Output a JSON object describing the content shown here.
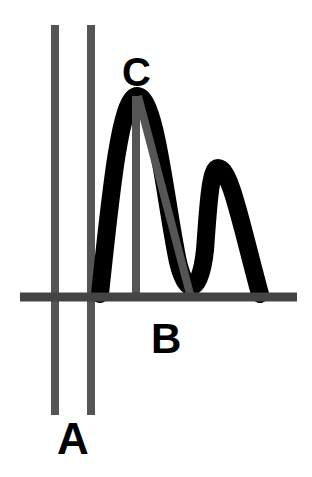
{
  "diagram": {
    "background": "#ffffff",
    "colors": {
      "curve": "#000000",
      "lines": "#555555",
      "text": "#000000"
    },
    "labels": {
      "peak": "C",
      "baseline_point": "B",
      "parallel_lines": "A"
    },
    "elements": {
      "baseline": {
        "x1": 20,
        "y1": 297,
        "x2": 297,
        "y2": 297,
        "width": 9
      },
      "line_a_left": {
        "x1": 55,
        "y1": 25,
        "x2": 55,
        "y2": 415,
        "width": 8
      },
      "line_a_right": {
        "x1": 91,
        "y1": 25,
        "x2": 91,
        "y2": 415,
        "width": 8
      },
      "peak_vertical": {
        "x1": 136,
        "y1": 96,
        "x2": 136,
        "y2": 296,
        "width": 8
      },
      "peak_diagonal": {
        "x1": 138,
        "y1": 96,
        "x2": 190,
        "y2": 294,
        "width": 8
      },
      "curve_path": "M 100 294 C 110 200, 120 96, 137 96 C 156 96, 165 200, 178 262 C 186 296, 200 296, 205 250 C 208 210, 210 168, 218 168 C 230 168, 240 220, 260 294",
      "curve_width": 18
    }
  }
}
